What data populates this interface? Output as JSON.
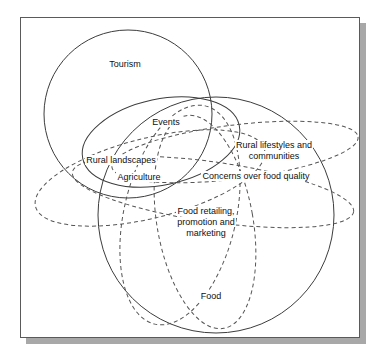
{
  "figure": {
    "type": "venn-overlap-diagram",
    "frame": {
      "border_color": "#5a5a5a",
      "shadow_color": "#a8a8a8",
      "background": "#ffffff"
    },
    "stroke_colors": {
      "solid": "#3c3c3c",
      "dashed": "#555555"
    },
    "labels": {
      "tourism": "Tourism",
      "events": "Events",
      "rural_landscapes": "Rural landscapes",
      "rural_lifestyles": "Rural lifestyles and\ncommunities",
      "rural_lifestyles_line1": "Rural lifestyles and",
      "rural_lifestyles_line2": "communities",
      "agriculture": "Agriculture",
      "concerns_food_quality": "Concerns over food quality",
      "food_retailing_line1": "Food retailing,",
      "food_retailing_line2": "promotion and",
      "food_retailing_line3": "marketing",
      "food": "Food"
    },
    "sets": [
      {
        "name": "Tourism",
        "style": "solid",
        "shape": "circle"
      },
      {
        "name": "Events",
        "style": "solid",
        "shape": "ellipse"
      },
      {
        "name": "Rural landscapes",
        "style": "solid",
        "shape": "circle"
      },
      {
        "name": "Rural lifestyles and communities",
        "style": "dashed",
        "shape": "ellipse"
      },
      {
        "name": "Agriculture",
        "style": "dashed",
        "shape": "ellipse"
      },
      {
        "name": "Concerns over food quality",
        "style": "dashed",
        "shape": "ellipse"
      },
      {
        "name": "Food retailing, promotion and marketing",
        "style": "dashed",
        "shape": "ellipse"
      },
      {
        "name": "Food",
        "style": "dashed",
        "shape": "ellipse"
      }
    ]
  }
}
